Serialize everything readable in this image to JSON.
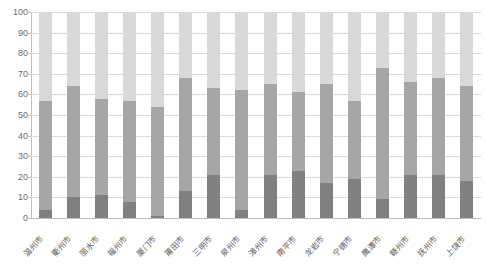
{
  "chart_data": {
    "type": "bar",
    "stacked": true,
    "title": "",
    "subtitle": "",
    "xlabel": "",
    "ylabel": "",
    "ylim": [
      0,
      100
    ],
    "yticks": [
      0,
      10,
      20,
      30,
      40,
      50,
      60,
      70,
      80,
      90,
      100
    ],
    "grid": true,
    "legend": false,
    "legend_position": "none",
    "categories": [
      "温州市",
      "衢州市",
      "丽水市",
      "福州市",
      "厦门市",
      "莆田市",
      "三明市",
      "泉州市",
      "漳州市",
      "南平市",
      "龙岩市",
      "宁德市",
      "鹰潭市",
      "赣州市",
      "抚州市",
      "上饶市"
    ],
    "series": [
      {
        "name": "series-1",
        "color": "#808080",
        "values": [
          4,
          10,
          11,
          8,
          1,
          13,
          21,
          4,
          21,
          23,
          17,
          19,
          9,
          21,
          21,
          18
        ]
      },
      {
        "name": "series-2",
        "color": "#a6a6a6",
        "values": [
          53,
          54,
          47,
          49,
          53,
          55,
          42,
          58,
          44,
          38,
          48,
          38,
          64,
          45,
          47,
          46
        ]
      },
      {
        "name": "series-3",
        "color": "#d9d9d9",
        "values": [
          43,
          36,
          42,
          43,
          46,
          32,
          37,
          38,
          35,
          39,
          35,
          43,
          27,
          34,
          32,
          36
        ]
      }
    ],
    "cumulative_tops": {
      "segment1_top": [
        4,
        10,
        11,
        8,
        1,
        13,
        21,
        4,
        21,
        23,
        17,
        19,
        9,
        21,
        21,
        18
      ],
      "segment2_top": [
        57,
        64,
        58,
        57,
        54,
        68,
        63,
        62,
        65,
        61,
        65,
        57,
        73,
        66,
        68,
        64
      ],
      "segment3_top": [
        100,
        100,
        100,
        100,
        100,
        100,
        100,
        100,
        100,
        100,
        100,
        100,
        100,
        100,
        100,
        100
      ]
    },
    "colors": {
      "series1": "#808080",
      "series2": "#a6a6a6",
      "series3": "#d9d9d9",
      "gridline": "#d9d9d9",
      "axis": "#bfbfbf",
      "tick_label": "#6b6b6b",
      "category_label": "#595959",
      "background": "#ffffff"
    }
  }
}
